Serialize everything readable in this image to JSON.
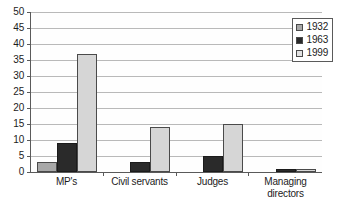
{
  "chart_data": {
    "type": "bar",
    "title": "",
    "subtitle": "",
    "xlabel": "",
    "ylabel": "",
    "ylim": [
      0,
      50
    ],
    "ytick_step": 5,
    "yticks": [
      "50",
      "45",
      "40",
      "35",
      "30",
      "25",
      "20",
      "15",
      "10",
      "5",
      "0"
    ],
    "grid": true,
    "legend_position": "top-right",
    "categories": [
      "MP's",
      "Civil servants",
      "Judges",
      "Managing directors"
    ],
    "series": [
      {
        "name": "1932",
        "color": "#a8a8a8",
        "values": [
          3,
          0,
          0,
          0
        ]
      },
      {
        "name": "1963",
        "color": "#2a2a2a",
        "values": [
          9,
          3,
          5,
          1
        ]
      },
      {
        "name": "1999",
        "color": "#d6d6d6",
        "values": [
          37,
          14,
          15,
          1
        ]
      }
    ]
  },
  "legend": {
    "items": [
      {
        "label": "1932"
      },
      {
        "label": "1963"
      },
      {
        "label": "1999"
      }
    ]
  }
}
